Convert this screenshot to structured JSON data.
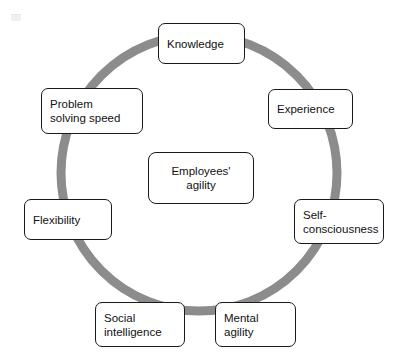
{
  "diagram": {
    "type": "cycle",
    "title": "Employees' agility",
    "ring_color": "#8c8c8c",
    "node_border_color": "#1a1a1a",
    "node_fill_color": "#ffffff",
    "background_color": "#ffffff",
    "center": {
      "label": "Employees'\nagility"
    },
    "nodes": [
      {
        "id": "knowledge",
        "label": "Knowledge",
        "position": "top",
        "angle_deg": 90
      },
      {
        "id": "experience",
        "label": "Experience",
        "position": "upper-right",
        "angle_deg": 39
      },
      {
        "id": "self-consciousness",
        "label": "Self-\nconsciousness",
        "position": "right",
        "angle_deg": -12
      },
      {
        "id": "mental-agility",
        "label": "Mental\nagility",
        "position": "lower-right",
        "angle_deg": -63
      },
      {
        "id": "social-intelligence",
        "label": "Social\nintelligence",
        "position": "lower-left",
        "angle_deg": -117
      },
      {
        "id": "flexibility",
        "label": "Flexibility",
        "position": "left",
        "angle_deg": 192
      },
      {
        "id": "problem-solving-speed",
        "label": "Problem\nsolving speed",
        "position": "upper-left",
        "angle_deg": 141
      }
    ]
  }
}
